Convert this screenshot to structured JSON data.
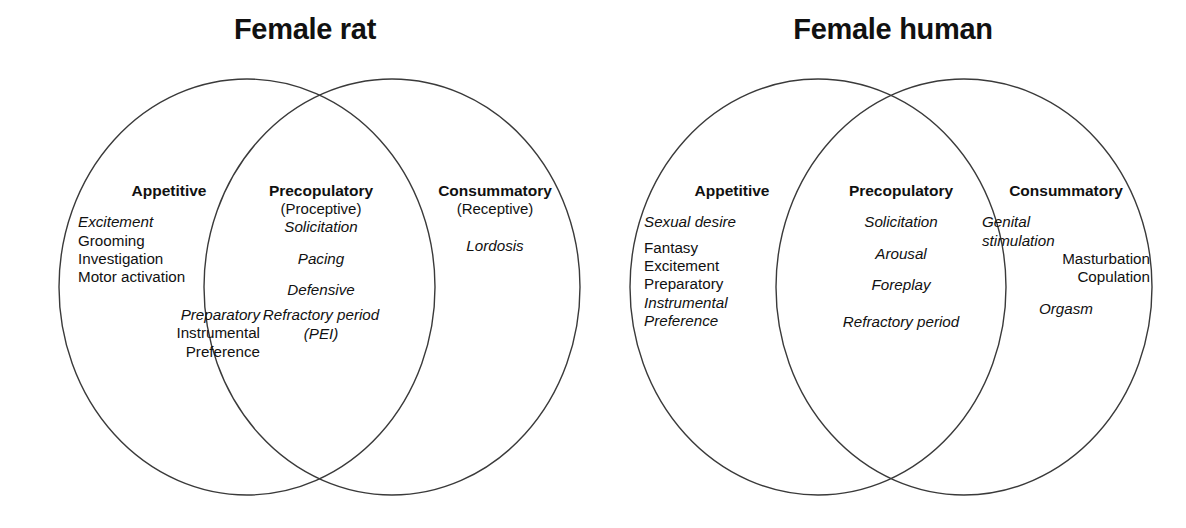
{
  "figure": {
    "type": "venn-diagram-pair",
    "background_color": "#ffffff",
    "stroke_color": "#3a3a3a"
  },
  "rat": {
    "title": "Female rat",
    "appetitive": {
      "head": "Appetitive",
      "terms_group1": [
        {
          "text": "Excitement",
          "style": "italic"
        },
        {
          "text": "Grooming",
          "style": "normal"
        },
        {
          "text": "Investigation",
          "style": "normal"
        },
        {
          "text": "Motor activation",
          "style": "normal"
        }
      ],
      "terms_group2": [
        {
          "text": "Preparatory",
          "style": "italic"
        },
        {
          "text": "Instrumental",
          "style": "normal"
        },
        {
          "text": "Preference",
          "style": "normal"
        }
      ]
    },
    "precopulatory": {
      "head": "Precopulatory",
      "sub": "(Proceptive)",
      "terms": [
        {
          "text": "Solicitation",
          "style": "italic"
        },
        {
          "text": "Pacing",
          "style": "italic"
        },
        {
          "text": "Defensive",
          "style": "italic"
        },
        {
          "text": "Refractory period",
          "style": "italic"
        },
        {
          "text": "(PEI)",
          "style": "italic"
        }
      ]
    },
    "consummatory": {
      "head": "Consummatory",
      "sub": "(Receptive)",
      "terms": [
        {
          "text": "Lordosis",
          "style": "italic"
        }
      ]
    }
  },
  "human": {
    "title": "Female human",
    "appetitive": {
      "head": "Appetitive",
      "terms_group1": [
        {
          "text": "Sexual desire",
          "style": "italic"
        }
      ],
      "terms_group2": [
        {
          "text": "Fantasy",
          "style": "normal"
        },
        {
          "text": "Excitement",
          "style": "normal"
        },
        {
          "text": "Preparatory",
          "style": "normal"
        },
        {
          "text": "Instrumental",
          "style": "italic"
        },
        {
          "text": "Preference",
          "style": "italic"
        }
      ]
    },
    "precopulatory": {
      "head": "Precopulatory",
      "terms": [
        {
          "text": "Solicitation",
          "style": "italic"
        },
        {
          "text": "Arousal",
          "style": "italic"
        },
        {
          "text": "Foreplay",
          "style": "italic"
        },
        {
          "text": "Refractory period",
          "style": "italic"
        }
      ]
    },
    "consummatory": {
      "head": "Consummatory",
      "terms_group1": [
        {
          "text": "Genital",
          "style": "italic"
        },
        {
          "text": "stimulation",
          "style": "italic"
        }
      ],
      "terms_group2": [
        {
          "text": "Masturbation",
          "style": "normal"
        },
        {
          "text": "Copulation",
          "style": "normal"
        }
      ],
      "terms_group3": [
        {
          "text": "Orgasm",
          "style": "italic"
        }
      ]
    }
  }
}
